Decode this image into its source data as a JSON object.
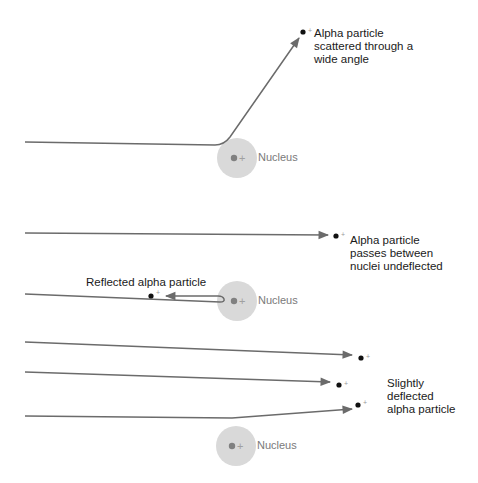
{
  "colors": {
    "trajectory": "#6b6b6b",
    "nucleus_halo": "#d9d9d9",
    "nucleus_core": "#808080",
    "particle": "#111111",
    "label_text": "#1a1a1a",
    "nucleus_label_text": "#7a7a7a"
  },
  "panels": [
    {
      "id": "wide-angle",
      "label_lines": [
        "Alpha particle",
        "scattered through a",
        "wide angle"
      ],
      "nucleus_label": "Nucleus",
      "charge_symbol": "+"
    },
    {
      "id": "undeflected",
      "label_lines": [
        "Alpha particle",
        "passes between",
        "nuclei undeflected"
      ],
      "charge_symbol": "+"
    },
    {
      "id": "reflected",
      "label_lines": [
        "Reflected alpha particle"
      ],
      "nucleus_label": "Nucleus",
      "charge_symbol": "+"
    },
    {
      "id": "slightly-deflected",
      "label_lines": [
        "Slightly",
        "deflected",
        "alpha particle"
      ],
      "nucleus_label": "Nucleus",
      "charge_symbol": "+"
    }
  ]
}
